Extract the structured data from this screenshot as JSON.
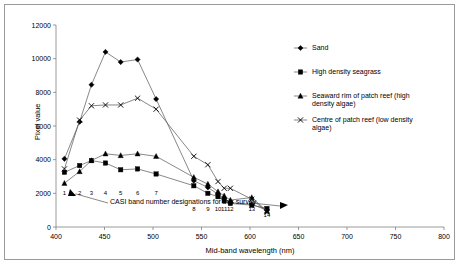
{
  "figure": {
    "border_color": "#9a9a9a",
    "background": "#ffffff"
  },
  "chart_data": {
    "type": "line",
    "title": "",
    "xlabel": "Mid-band wavelength (nm)",
    "ylabel": "Pixel value",
    "xlim": [
      400,
      800
    ],
    "ylim": [
      0,
      12000
    ],
    "xticks": [
      400,
      450,
      500,
      550,
      600,
      650,
      700,
      750,
      800
    ],
    "yticks": [
      0,
      2000,
      4000,
      6000,
      8000,
      10000,
      12000
    ],
    "grid": false,
    "legend_position": "right",
    "x": [
      415,
      442,
      463,
      488,
      515,
      545,
      578,
      645,
      670,
      688,
      699,
      710,
      748,
      775
    ],
    "band_numbers": [
      1,
      2,
      3,
      4,
      5,
      6,
      7,
      8,
      9,
      10,
      11,
      12,
      13,
      14
    ],
    "series": [
      {
        "name": "Sand",
        "marker": "diamond",
        "values": [
          4050,
          6250,
          8450,
          10400,
          9800,
          9950,
          7600,
          2750,
          2350,
          1950,
          1700,
          1450,
          1350,
          1000
        ]
      },
      {
        "name": "High density seagrass",
        "marker": "square",
        "values": [
          3250,
          3650,
          3950,
          3800,
          3400,
          3450,
          3150,
          2450,
          2000,
          1800,
          1550,
          1400,
          1300,
          1100
        ]
      },
      {
        "name": "Seaward rim of patch reef (high density algae)",
        "marker": "triangle",
        "values": [
          2600,
          3300,
          3950,
          4350,
          4250,
          4350,
          4200,
          2950,
          2550,
          2100,
          1850,
          1600,
          1750,
          950
        ]
      },
      {
        "name": "Centre of patch reef (low density algae)",
        "marker": "cross",
        "values": [
          3450,
          6350,
          7200,
          7250,
          7250,
          7650,
          7000,
          4200,
          3700,
          2700,
          2300,
          2300,
          1650,
          900
        ]
      }
    ],
    "annotation": {
      "text": "CASI band number designations for this survey",
      "arrow_targets": [
        "band-1",
        "band-8"
      ]
    }
  },
  "legend": {
    "entries": [
      {
        "label": "Sand",
        "marker": "diamond"
      },
      {
        "label": "High density seagrass",
        "marker": "square"
      },
      {
        "label": "Seaward rim of patch reef (high density algae)",
        "marker": "triangle"
      },
      {
        "label": "Centre of patch reef (low density algae)",
        "marker": "cross"
      }
    ]
  }
}
